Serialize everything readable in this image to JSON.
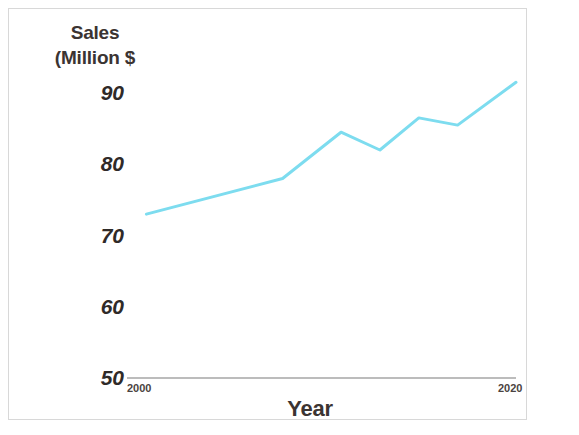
{
  "chart_data": {
    "type": "line",
    "title": "",
    "xlabel": "Year",
    "ylabel": "Sales (Million $",
    "ylabel_lines": [
      "Sales",
      "(Million $"
    ],
    "x": [
      2001,
      2008,
      2011,
      2013,
      2015,
      2017,
      2020
    ],
    "values": [
      73,
      78,
      84.5,
      82,
      86.5,
      85.5,
      91.5
    ],
    "series": [
      {
        "name": "Sales",
        "color": "#7ddcef",
        "values": [
          73,
          78,
          84.5,
          82,
          86.5,
          85.5,
          91.5
        ]
      }
    ],
    "xlim": [
      2000,
      2020
    ],
    "ylim": [
      50,
      90
    ],
    "ytick_labels": [
      "90",
      "80",
      "70",
      "60",
      "50"
    ],
    "ytick_values": [
      90,
      80,
      70,
      60,
      50
    ],
    "xtick_labels": [
      "2000",
      "2020"
    ],
    "xtick_values": [
      2000,
      2020
    ],
    "grid": false,
    "legend": "none",
    "line_color": "#7ddcef",
    "line_width": 3,
    "axis_color": "#9b9b9b",
    "text_color": "#2f2a28",
    "background": "#ffffff"
  }
}
